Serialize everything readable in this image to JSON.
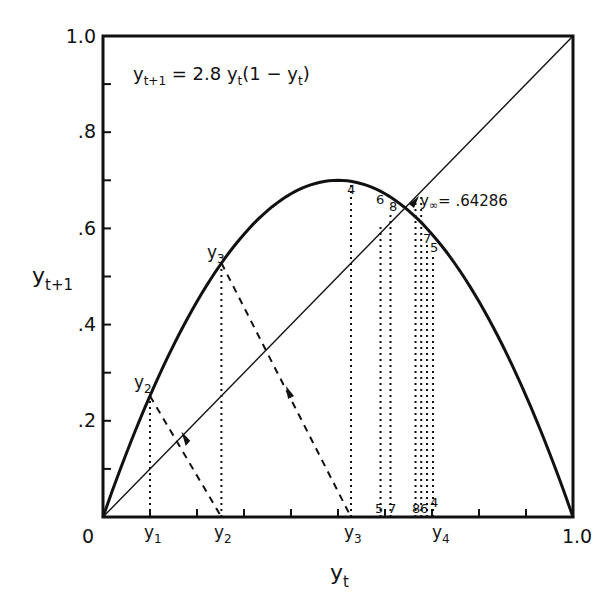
{
  "chart_data": {
    "type": "line",
    "equation": "y_{t+1} = 2.8 y_t (1 - y_t)",
    "equation_parts": {
      "lhs": "y",
      "lhs_sub": "t+1",
      "eq": " = 2.8 ",
      "var": "y",
      "var_sub": "t",
      "rest": "(1 − ",
      "var2": "y",
      "var2_sub": "t",
      "close": ")"
    },
    "xlabel": "y_t",
    "ylabel": "y_{t+1}",
    "xlim": [
      0,
      1.0
    ],
    "ylim": [
      0,
      1.0
    ],
    "grid": false,
    "r": 2.8,
    "x_tick_labels": [
      {
        "value": 0,
        "label": "0"
      },
      {
        "value": 1.0,
        "label": "1.0"
      }
    ],
    "x_minor_ticks": [
      0.1,
      0.2,
      0.3,
      0.4,
      0.5,
      0.6,
      0.7,
      0.8,
      0.9
    ],
    "y_tick_labels": [
      {
        "value": 0.2,
        "label": ".2"
      },
      {
        "value": 0.4,
        "label": ".4"
      },
      {
        "value": 0.6,
        "label": ".6"
      },
      {
        "value": 0.8,
        "label": ".8"
      },
      {
        "value": 1.0,
        "label": "1.0"
      }
    ],
    "y_minor_ticks": [
      0.1,
      0.3,
      0.5,
      0.7,
      0.9
    ],
    "series": [
      {
        "name": "logistic curve y_{t+1} = 2.8 y_t (1 - y_t)",
        "style": "solid-thick",
        "peak": {
          "x": 0.5,
          "y": 0.7
        }
      },
      {
        "name": "45-degree line y_{t+1} = y_t",
        "style": "solid-thin",
        "x": [
          0,
          1
        ],
        "y": [
          0,
          1
        ]
      }
    ],
    "iterates": [
      {
        "index": 1,
        "value": 0.1,
        "label": "y1"
      },
      {
        "index": 2,
        "value": 0.252,
        "label": "y2"
      },
      {
        "index": 3,
        "value": 0.5278,
        "label": "y3"
      },
      {
        "index": 4,
        "value": 0.6978,
        "label": "y4"
      },
      {
        "index": 5,
        "value": 0.5905,
        "label": "5"
      },
      {
        "index": 6,
        "value": 0.6771,
        "label": "6"
      },
      {
        "index": 7,
        "value": 0.6122,
        "label": "7"
      },
      {
        "index": 8,
        "value": 0.6648,
        "label": "8"
      }
    ],
    "fixed_point": {
      "value": 0.64286,
      "label": "y∞ = .64286"
    },
    "annotations": [
      "y1",
      "y2",
      "y3",
      "y4",
      "4",
      "5",
      "6",
      "7",
      "8",
      "y∞ = .64286"
    ]
  },
  "labels": {
    "x_axis_title": "y",
    "x_axis_title_sub": "t",
    "y_axis_title": "y",
    "y_axis_title_sub": "t+1",
    "origin": "0",
    "x_end": "1.0",
    "fixed_point_var": "y",
    "fixed_point_sub": "∞",
    "fixed_point_value": "= .64286",
    "curve_y2": "y",
    "curve_y2_sub": "2",
    "curve_y3": "y",
    "curve_y3_sub": "3",
    "axis_y1": "y",
    "axis_y1_sub": "1",
    "axis_y2": "y",
    "axis_y2_sub": "2",
    "axis_y3": "y",
    "axis_y3_sub": "3",
    "axis_y4": "y",
    "axis_y4_sub": "4",
    "top_4": "4",
    "top_6": "6",
    "top_8": "8",
    "top_7": "7",
    "top_5": "5",
    "bot_5": "5",
    "bot_7": "7",
    "bot_8": "8",
    "bot_6": "6",
    "bot_4": "4"
  }
}
